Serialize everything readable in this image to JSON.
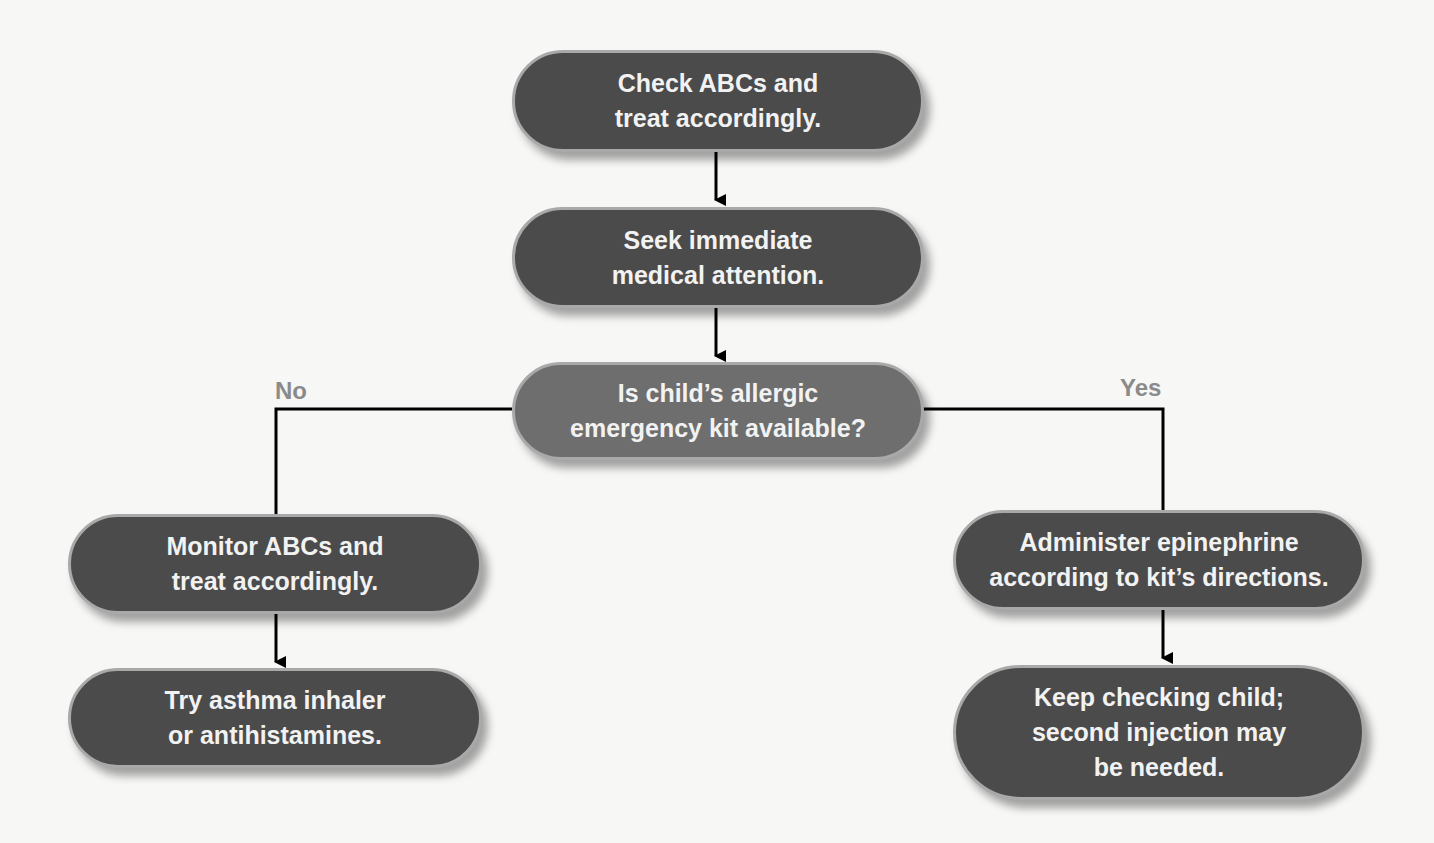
{
  "flowchart": {
    "nodes": {
      "check_abcs": {
        "text": "Check ABCs and\ntreat accordingly."
      },
      "seek_attention": {
        "text": "Seek immediate\nmedical attention."
      },
      "decision": {
        "text": "Is child’s allergic\nemergency kit available?"
      },
      "monitor_abcs": {
        "text": "Monitor ABCs and\ntreat accordingly."
      },
      "try_inhaler": {
        "text": "Try asthma inhaler\nor antihistamines."
      },
      "administer_epi": {
        "text": "Administer epinephrine\naccording to kit’s directions."
      },
      "keep_checking": {
        "text": "Keep checking child;\nsecond injection may\nbe needed."
      }
    },
    "branch_labels": {
      "no": "No",
      "yes": "Yes"
    },
    "colors": {
      "node_fill": "#4b4b4b",
      "decision_fill": "#6e6e6e",
      "node_border": "#a9a9a9",
      "label": "#8a8a8a",
      "line": "#000000"
    }
  }
}
